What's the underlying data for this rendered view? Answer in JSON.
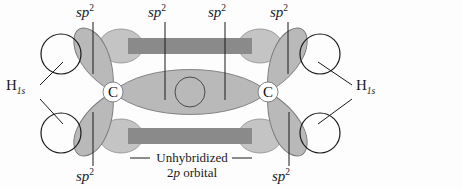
{
  "figure": {
    "title_text": "",
    "background_color": "#fdfdfd"
  },
  "colors": {
    "orbital_fill": "#b9b9b9",
    "orbital_stroke": "#6e6e6e",
    "pi_bar": "#8a8a8a",
    "p_lobe": "#c4c4c4",
    "hydrogen_stroke": "#1a1a1a",
    "leader_line": "#1a1a1a",
    "text": "#1b1b1b",
    "atom_disc": "#ffffff"
  },
  "atoms": [
    {
      "symbol": "C",
      "x": 113,
      "y": 92
    },
    {
      "symbol": "C",
      "x": 268,
      "y": 92
    }
  ],
  "sp2_labels": [
    {
      "id": "sp2-top-left-outer",
      "text": "sp",
      "sup": "2",
      "x": 76,
      "y": 4,
      "leader": {
        "x1": 93,
        "y1": 22,
        "x2": 93,
        "y2": 74
      }
    },
    {
      "id": "sp2-top-left-inner",
      "text": "sp",
      "sup": "2",
      "x": 148,
      "y": 4,
      "leader": {
        "x1": 165,
        "y1": 22,
        "x2": 165,
        "y2": 100
      }
    },
    {
      "id": "sp2-top-right-inner",
      "text": "sp",
      "sup": "2",
      "x": 208,
      "y": 4,
      "leader": {
        "x1": 225,
        "y1": 22,
        "x2": 225,
        "y2": 100
      }
    },
    {
      "id": "sp2-top-right-outer",
      "text": "sp",
      "sup": "2",
      "x": 270,
      "y": 4,
      "leader": {
        "x1": 288,
        "y1": 22,
        "x2": 288,
        "y2": 74
      }
    },
    {
      "id": "sp2-bottom-left",
      "text": "sp",
      "sup": "2",
      "x": 76,
      "y": 168,
      "leader": {
        "x1": 93,
        "y1": 166,
        "x2": 93,
        "y2": 112
      }
    },
    {
      "id": "sp2-bottom-right",
      "text": "sp",
      "sup": "2",
      "x": 272,
      "y": 168,
      "leader": {
        "x1": 289,
        "y1": 166,
        "x2": 289,
        "y2": 112
      }
    }
  ],
  "hydrogen_labels": [
    {
      "id": "h-left",
      "text": "H",
      "sub": "1s",
      "x": 6,
      "y": 76
    },
    {
      "id": "h-right",
      "text": "H",
      "sub": "1s",
      "x": 356,
      "y": 76
    }
  ],
  "callout": {
    "line1": "Unhybridized",
    "line2_prefix": "2",
    "line2_italic": "p",
    "line2_suffix": " orbital",
    "x": 152,
    "y": 158
  },
  "pi_bars": [
    {
      "id": "pi-bar-top",
      "x": 128,
      "y": 38,
      "w": 124,
      "h": 16
    },
    {
      "id": "pi-bar-bottom",
      "x": 128,
      "y": 128,
      "w": 124,
      "h": 16
    }
  ],
  "hydrogen_orbitals": [
    {
      "id": "h1s-upper-left",
      "cx": 61,
      "cy": 54,
      "r": 20
    },
    {
      "id": "h1s-lower-left",
      "cx": 61,
      "cy": 133,
      "r": 20
    },
    {
      "id": "h1s-upper-right",
      "cx": 320,
      "cy": 54,
      "r": 20
    },
    {
      "id": "h1s-lower-right",
      "cx": 320,
      "cy": 133,
      "r": 20
    }
  ],
  "sigma_overlap": {
    "id": "sigma-bond-overlap",
    "center_circle": {
      "cx": 190,
      "cy": 92,
      "r": 15
    }
  }
}
